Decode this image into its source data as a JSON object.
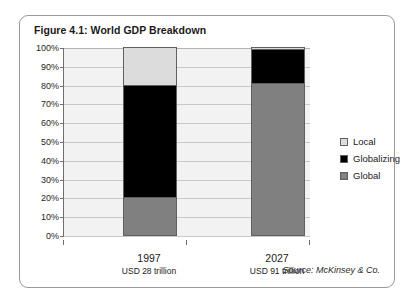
{
  "figure": {
    "title": "Figure 4.1: World GDP Breakdown",
    "source": "Source: McKinsey & Co."
  },
  "chart_data": {
    "type": "bar",
    "stacked": true,
    "title": "Figure 4.1: World GDP Breakdown",
    "xlabel": "",
    "ylabel": "",
    "categories": [
      "1997",
      "2027"
    ],
    "category_sublabels": [
      "USD 28 trillion",
      "USD 91 trillion"
    ],
    "series": [
      {
        "name": "Local",
        "values": [
          20,
          1
        ],
        "color": "#dcdcdc"
      },
      {
        "name": "Globalizing",
        "values": [
          60,
          18
        ],
        "color": "#000000"
      },
      {
        "name": "Global",
        "values": [
          20,
          81
        ],
        "color": "#808080"
      }
    ],
    "stack_order_bottom_to_top": [
      "Global",
      "Globalizing",
      "Local"
    ],
    "ylim": [
      0,
      100
    ],
    "yticks": [
      "0%",
      "10%",
      "20%",
      "30%",
      "40%",
      "50%",
      "60%",
      "70%",
      "80%",
      "90%",
      "100%"
    ],
    "ytick_values": [
      0,
      10,
      20,
      30,
      40,
      50,
      60,
      70,
      80,
      90,
      100
    ],
    "grid": true,
    "legend_position": "right",
    "legend_entries": [
      "Local",
      "Globalizing",
      "Global"
    ]
  }
}
